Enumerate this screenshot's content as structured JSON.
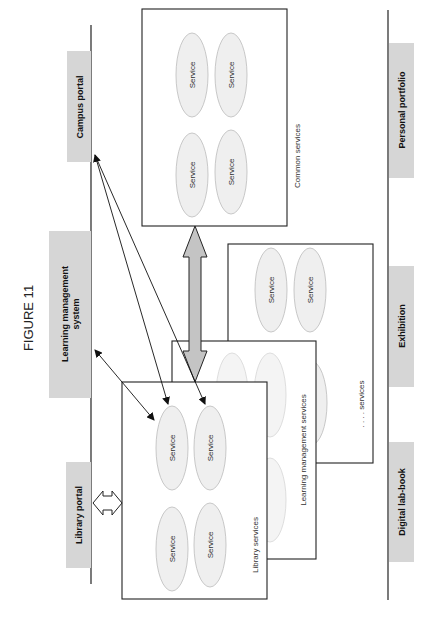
{
  "figure": {
    "title": "FIGURE 11",
    "orientation": "rotated 90 degrees counter-clockwise"
  },
  "portals_left": [
    {
      "label": "Campus portal"
    },
    {
      "label": "Learning management system",
      "line1": "Learning management",
      "line2": "system"
    },
    {
      "label": "Library portal"
    }
  ],
  "portals_right": [
    {
      "label": "Personal portfolio"
    },
    {
      "label": "Exhibition"
    },
    {
      "label": "Digital lab-book"
    }
  ],
  "service_groups": [
    {
      "name": "Common services",
      "label": "Common services",
      "services": [
        "Service",
        "Service",
        "Service",
        "Service"
      ]
    },
    {
      "name": "Other services",
      "label": ". . . . services",
      "services": [
        "Service",
        "Service",
        "Service"
      ]
    },
    {
      "name": "Learning management services",
      "label": "Learning management services",
      "services": []
    },
    {
      "name": "Library services",
      "label": "Library services",
      "services": [
        "Service",
        "Service",
        "Service",
        "Service"
      ]
    }
  ],
  "service_label": "Service",
  "colors": {
    "portal_fill": "#d6d6d6",
    "service_fill": "#efefef",
    "service_stroke": "#c8c8c8",
    "arrow_fill": "#c4c4c4",
    "line": "#222222"
  }
}
